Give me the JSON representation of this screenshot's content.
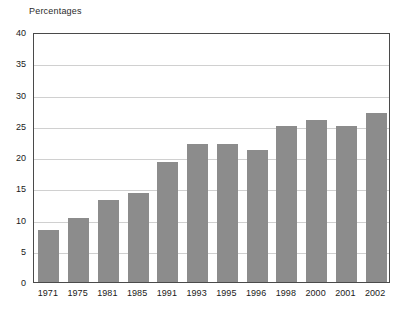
{
  "chart_data": {
    "type": "bar",
    "title": "Percentages",
    "xlabel": "",
    "ylabel": "",
    "categories": [
      "1971",
      "1975",
      "1981",
      "1985",
      "1991",
      "1993",
      "1995",
      "1996",
      "1998",
      "2000",
      "2001",
      "2002"
    ],
    "values": [
      8.3,
      10.2,
      13.2,
      14.2,
      19.2,
      22.1,
      22.1,
      21.1,
      25.0,
      26.0,
      25.0,
      27.0
    ],
    "ylim": [
      0,
      40
    ],
    "ytick_labels": [
      "0",
      "5",
      "10",
      "15",
      "20",
      "25",
      "30",
      "35",
      "40"
    ],
    "ytick_values": [
      0,
      5,
      10,
      15,
      20,
      25,
      30,
      35,
      40
    ],
    "grid": true,
    "legend": false,
    "bar_color": "#8c8c8c",
    "grid_color": "#d0d0d0",
    "axis_color": "#4a4a4a",
    "background_color": "#ffffff"
  }
}
